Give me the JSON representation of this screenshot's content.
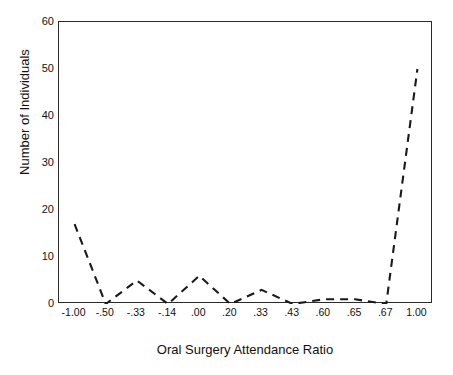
{
  "chart_data": {
    "type": "line",
    "title": "",
    "xlabel": "Oral Surgery Attendance Ratio",
    "ylabel": "Number of Individuals",
    "categories": [
      "-1.00",
      "-.50",
      "-.33",
      "-.14",
      ".00",
      ".20",
      ".33",
      ".43",
      ".60",
      ".65",
      ".67",
      "1.00"
    ],
    "values": [
      17,
      0,
      5,
      0,
      6,
      0,
      3,
      0,
      1,
      1,
      0,
      50
    ],
    "series": [
      {
        "name": "Number of Individuals",
        "values": [
          17,
          0,
          5,
          0,
          6,
          0,
          3,
          0,
          1,
          1,
          0,
          50
        ]
      }
    ],
    "ylim": [
      0,
      60
    ],
    "yticks": [
      0,
      10,
      20,
      30,
      40,
      50,
      60
    ],
    "ytick_labels": [
      "0",
      "10",
      "20",
      "30",
      "40",
      "50",
      "60"
    ],
    "grid": false,
    "legend": false,
    "line_style": "dashed",
    "line_color": "#1a1a1a",
    "markers": false,
    "background_color": "#ffffff",
    "axis_color": "#2b2b2b"
  }
}
